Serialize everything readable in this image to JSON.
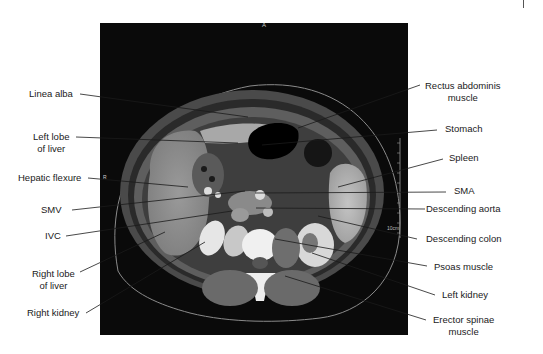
{
  "figure": {
    "orientation_markers": {
      "anterior": "A",
      "right": "R"
    },
    "scale_label": "10cm",
    "colors": {
      "background": "#ffffff",
      "panel": "#0a0a0a",
      "leader": "#1a1a1a",
      "text": "#1a1a1a"
    }
  },
  "labels": {
    "left": [
      {
        "id": "linea-alba",
        "line1": "Linea alba",
        "line2": ""
      },
      {
        "id": "left-lobe-of-liver",
        "line1": "Left lobe",
        "line2": "of liver"
      },
      {
        "id": "hepatic-flexure",
        "line1": "Hepatic flexure",
        "line2": ""
      },
      {
        "id": "smv",
        "line1": "SMV",
        "line2": ""
      },
      {
        "id": "ivc",
        "line1": "IVC",
        "line2": ""
      },
      {
        "id": "right-lobe-of-liver",
        "line1": "Right lobe",
        "line2": "of liver"
      },
      {
        "id": "right-kidney",
        "line1": "Right kidney",
        "line2": ""
      }
    ],
    "right": [
      {
        "id": "rectus-abdominis-muscle",
        "line1": "Rectus abdominis",
        "line2": "muscle"
      },
      {
        "id": "stomach",
        "line1": "Stomach",
        "line2": ""
      },
      {
        "id": "spleen",
        "line1": "Spleen",
        "line2": ""
      },
      {
        "id": "sma",
        "line1": "SMA",
        "line2": ""
      },
      {
        "id": "descending-aorta",
        "line1": "Descending aorta",
        "line2": ""
      },
      {
        "id": "descending-colon",
        "line1": "Descending colon",
        "line2": ""
      },
      {
        "id": "psoas-muscle",
        "line1": "Psoas muscle",
        "line2": ""
      },
      {
        "id": "left-kidney",
        "line1": "Left kidney",
        "line2": ""
      },
      {
        "id": "erector-spinae-muscle",
        "line1": "Erector spinae",
        "line2": "muscle"
      }
    ]
  }
}
